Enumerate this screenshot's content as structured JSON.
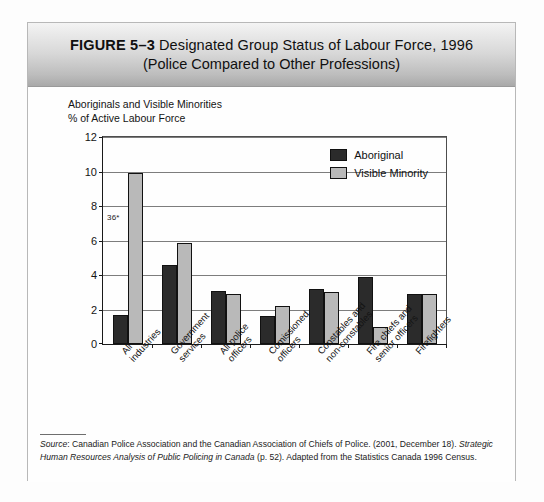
{
  "figure": {
    "number_label": "FIGURE 5–3",
    "title_line1": "Designated Group Status of Labour Force, 1996",
    "title_line2": "(Police Compared to Other Professions)"
  },
  "axis_caption": {
    "line1": "Aboriginals and Visible Minorities",
    "line2": "% of Active Labour Force"
  },
  "annotation": {
    "label": "36*"
  },
  "legend": {
    "items": [
      {
        "label": "Aboriginal",
        "color": "#2b2b2b"
      },
      {
        "label": "Visible Minority",
        "color": "#b9b9b9"
      }
    ]
  },
  "source_note": {
    "word": "Source",
    "text_1": ": Canadian Police Association and the Canadian Association of Chiefs of Police. (2001, December 18). ",
    "italic_1": "Strategic Human Resources Analysis of Public Policing in Canada",
    "text_2": " (p. 52). Adapted from the Statistics Canada 1996 Census."
  },
  "chart_data": {
    "type": "bar",
    "title": "Designated Group Status of Labour Force, 1996 (Police Compared to Other Professions)",
    "xlabel": "",
    "ylabel": "Aboriginals and Visible Minorities % of Active Labour Force",
    "ylim": [
      0,
      12
    ],
    "yticks": [
      0,
      2,
      4,
      6,
      8,
      10,
      12
    ],
    "grid": "horizontal",
    "legend_position": "inside top-right",
    "categories": [
      "All industries",
      "Government services",
      "All police officers",
      "Comissioned officers",
      "Constables and non-constables",
      "Fire chiefs and senior officers",
      "Firefighters"
    ],
    "category_lines": [
      [
        "All",
        "industries"
      ],
      [
        "Government",
        "services"
      ],
      [
        "All police",
        "officers"
      ],
      [
        "Comissioned",
        "officers"
      ],
      [
        "Constables and",
        "non-constables"
      ],
      [
        "Fire chiefs and",
        "senior officers"
      ],
      [
        "Firefighters"
      ]
    ],
    "series": [
      {
        "name": "Aboriginal",
        "color": "#2b2b2b",
        "values": [
          1.7,
          4.6,
          3.1,
          1.6,
          3.2,
          3.9,
          2.9
        ]
      },
      {
        "name": "Visible Minority",
        "color": "#b9b9b9",
        "values": [
          9.9,
          5.85,
          2.9,
          2.2,
          3.0,
          1.0,
          2.9
        ]
      }
    ],
    "annotations": [
      {
        "text": "36*",
        "near_category": "All industries",
        "y": 7.6
      }
    ]
  }
}
